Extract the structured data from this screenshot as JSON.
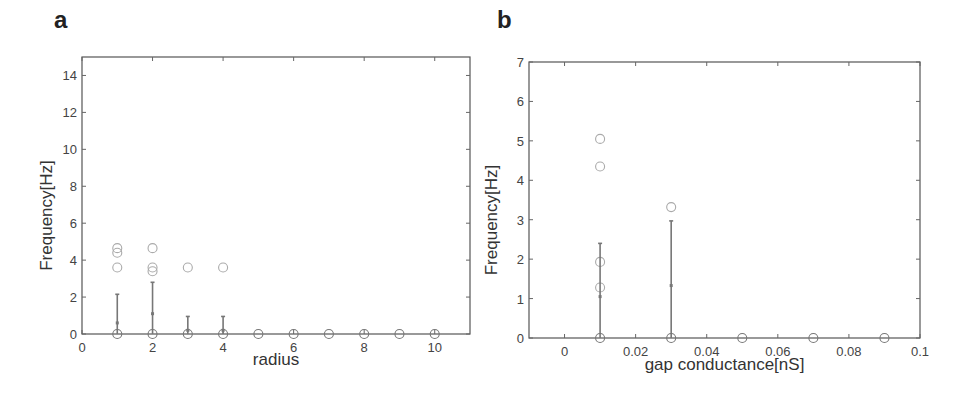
{
  "panels": {
    "a": {
      "label": "a"
    },
    "b": {
      "label": "b"
    }
  },
  "chart_data": [
    {
      "id": "a",
      "type": "scatter",
      "title": "",
      "panel_label": "a",
      "xlabel": "radius",
      "ylabel": "Frequency[Hz]",
      "xlim": [
        0,
        11
      ],
      "ylim": [
        0,
        15
      ],
      "xticks": [
        0,
        2,
        4,
        6,
        8,
        10
      ],
      "yticks": [
        0,
        2,
        4,
        6,
        8,
        10,
        12,
        14
      ],
      "grid": false,
      "legend": null,
      "series": [
        {
          "name": "trials",
          "marker": "open-circle",
          "points": [
            [
              1,
              0
            ],
            [
              1,
              3.6
            ],
            [
              1,
              4.4
            ],
            [
              1,
              4.65
            ],
            [
              2,
              0
            ],
            [
              2,
              3.4
            ],
            [
              2,
              3.6
            ],
            [
              2,
              4.65
            ],
            [
              3,
              0
            ],
            [
              3,
              3.6
            ],
            [
              4,
              0
            ],
            [
              4,
              3.6
            ],
            [
              5,
              0
            ],
            [
              6,
              0
            ],
            [
              7,
              0
            ],
            [
              8,
              0
            ],
            [
              9,
              0
            ],
            [
              10,
              0
            ]
          ]
        },
        {
          "name": "mean ± sd",
          "marker": "errorbar",
          "points": [
            {
              "x": 1,
              "mean": 0.6,
              "low": 0,
              "high": 2.15
            },
            {
              "x": 2,
              "mean": 1.1,
              "low": 0,
              "high": 2.8
            },
            {
              "x": 3,
              "mean": 0.2,
              "low": 0,
              "high": 0.95
            },
            {
              "x": 4,
              "mean": 0.2,
              "low": 0,
              "high": 0.95
            }
          ]
        }
      ]
    },
    {
      "id": "b",
      "type": "scatter",
      "title": "",
      "panel_label": "b",
      "xlabel": "gap conductance[nS]",
      "ylabel": "Frequency[Hz]",
      "xlim": [
        -0.01,
        0.1
      ],
      "ylim": [
        0,
        7
      ],
      "xticks": [
        0,
        0.02,
        0.04,
        0.06,
        0.08,
        0.1
      ],
      "xtick_labels": [
        "0",
        "0.02",
        "0.04",
        "0.06",
        "0.08",
        "0.1"
      ],
      "yticks": [
        0,
        1,
        2,
        3,
        4,
        5,
        6,
        7
      ],
      "grid": false,
      "legend": null,
      "series": [
        {
          "name": "trials",
          "marker": "open-circle",
          "points": [
            [
              0.01,
              0
            ],
            [
              0.01,
              1.28
            ],
            [
              0.01,
              1.93
            ],
            [
              0.01,
              4.35
            ],
            [
              0.01,
              5.05
            ],
            [
              0.03,
              0
            ],
            [
              0.03,
              3.32
            ],
            [
              0.05,
              0
            ],
            [
              0.07,
              0
            ],
            [
              0.09,
              0
            ]
          ]
        },
        {
          "name": "mean ± sd",
          "marker": "errorbar",
          "points": [
            {
              "x": 0.01,
              "mean": 1.05,
              "low": 0,
              "high": 2.4
            },
            {
              "x": 0.03,
              "mean": 1.33,
              "low": 0,
              "high": 2.97
            }
          ]
        }
      ]
    }
  ]
}
